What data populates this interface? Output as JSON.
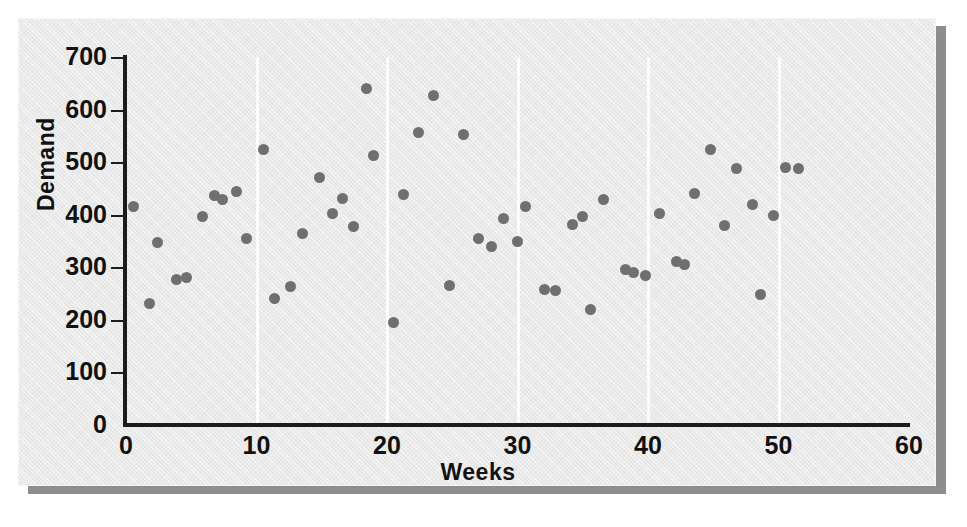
{
  "figure": {
    "background_color": "#e9e9e9",
    "shadow_color": "#8d8d8d",
    "point_color": "#6f6f6f",
    "axis_color": "#1c1c1c",
    "gridline_color": "#fbfbfb"
  },
  "chart_data": {
    "type": "scatter",
    "title": "",
    "xlabel": "Weeks",
    "ylabel": "Demand",
    "xlim": [
      0,
      60
    ],
    "ylim": [
      0,
      700
    ],
    "xticks": [
      0,
      10,
      20,
      30,
      40,
      50,
      60
    ],
    "yticks": [
      0,
      100,
      200,
      300,
      400,
      500,
      600,
      700
    ],
    "xticklabels": [
      "0",
      "10",
      "20",
      "30",
      "40",
      "50",
      "60"
    ],
    "yticklabels": [
      "0",
      "100",
      "200",
      "300",
      "400",
      "500",
      "600",
      "700"
    ],
    "grid": "vertical-only",
    "gridlines_x": [
      10,
      20,
      30,
      40,
      50
    ],
    "legend": null,
    "marker": "circle",
    "marker_size_px": 11,
    "series": [
      {
        "name": "Demand",
        "points": [
          [
            0.6,
            415
          ],
          [
            1.8,
            232
          ],
          [
            2.4,
            348
          ],
          [
            3.9,
            276
          ],
          [
            4.6,
            280
          ],
          [
            5.9,
            396
          ],
          [
            6.8,
            437
          ],
          [
            7.4,
            428
          ],
          [
            8.5,
            444
          ],
          [
            9.2,
            354
          ],
          [
            10.5,
            525
          ],
          [
            11.4,
            241
          ],
          [
            12.6,
            263
          ],
          [
            13.5,
            365
          ],
          [
            14.8,
            471
          ],
          [
            15.8,
            403
          ],
          [
            16.6,
            430
          ],
          [
            17.4,
            378
          ],
          [
            18.4,
            640
          ],
          [
            19.0,
            512
          ],
          [
            20.5,
            195
          ],
          [
            21.3,
            438
          ],
          [
            22.4,
            557
          ],
          [
            23.6,
            626
          ],
          [
            24.8,
            266
          ],
          [
            25.9,
            552
          ],
          [
            27.0,
            354
          ],
          [
            28.0,
            340
          ],
          [
            28.9,
            392
          ],
          [
            30.0,
            349
          ],
          [
            30.6,
            415
          ],
          [
            32.1,
            257
          ],
          [
            32.9,
            256
          ],
          [
            34.2,
            381
          ],
          [
            35.0,
            396
          ],
          [
            35.6,
            219
          ],
          [
            36.6,
            428
          ],
          [
            38.3,
            295
          ],
          [
            38.9,
            291
          ],
          [
            39.8,
            285
          ],
          [
            40.9,
            402
          ],
          [
            42.2,
            311
          ],
          [
            42.8,
            306
          ],
          [
            43.6,
            440
          ],
          [
            44.8,
            524
          ],
          [
            45.9,
            380
          ],
          [
            46.8,
            487
          ],
          [
            48.0,
            419
          ],
          [
            48.6,
            248
          ],
          [
            49.6,
            399
          ],
          [
            50.5,
            489
          ],
          [
            51.5,
            488
          ]
        ]
      }
    ]
  }
}
